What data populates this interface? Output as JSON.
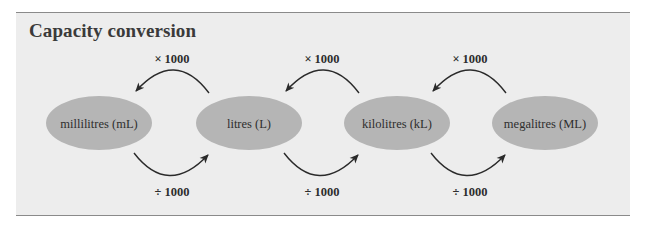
{
  "title": "Capacity conversion",
  "units": [
    {
      "label": "millilitres (mL)",
      "cx": 99,
      "cy": 123
    },
    {
      "label": "litres (L)",
      "cx": 249,
      "cy": 123
    },
    {
      "label": "kilolitres (kL)",
      "cx": 397,
      "cy": 123
    },
    {
      "label": "megalitres (ML)",
      "cx": 545,
      "cy": 123
    }
  ],
  "multiply_labels": [
    "× 1000",
    "× 1000",
    "× 1000"
  ],
  "divide_labels": [
    "÷ 1000",
    "÷ 1000",
    "÷ 1000"
  ],
  "colors": {
    "panel_background": "#ededed",
    "ellipse_fill": "#b5b5b5",
    "arrow": "#2a2a2a",
    "rule": "#8a8a8a"
  }
}
